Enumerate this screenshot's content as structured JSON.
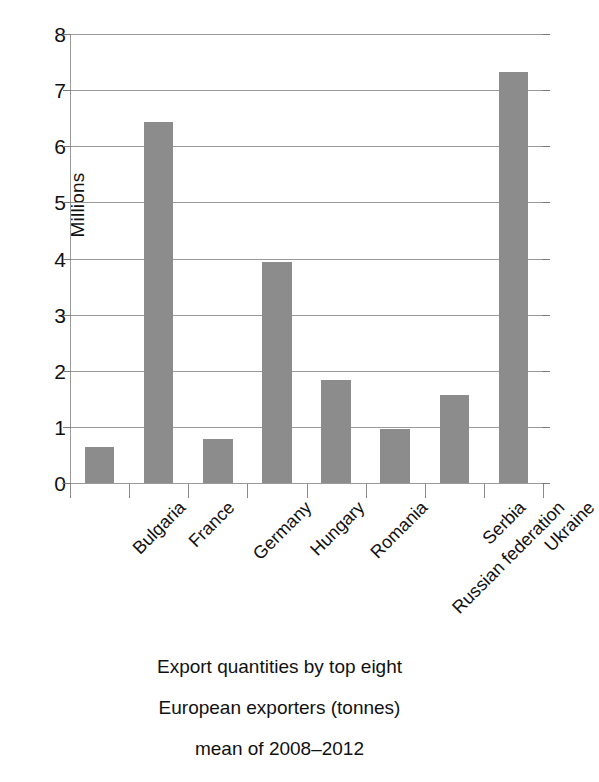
{
  "chart_data": {
    "type": "bar",
    "title": "",
    "categories": [
      "Bulgaria",
      "France",
      "Germany",
      "Hungary",
      "Romania",
      "Russian federation",
      "Serbia",
      "Ukraine"
    ],
    "values": [
      0.65,
      6.43,
      0.79,
      3.93,
      1.84,
      0.97,
      1.56,
      7.32
    ],
    "xlabel": "",
    "ylabel": "Millions",
    "ylim": [
      0,
      8
    ],
    "ytick_labels": [
      "8",
      "7",
      "6",
      "5",
      "4",
      "3",
      "2",
      "1",
      "0"
    ],
    "ytick_values": [
      8,
      7,
      6,
      5,
      4,
      3,
      2,
      1,
      0
    ],
    "grid": true,
    "legend": false,
    "bar_color": "#8c8c8c",
    "gridline_color": "#9a9a9a",
    "axis_color": "#8a8a8a",
    "text_color": "#111111"
  },
  "caption": {
    "lines": [
      "Export quantities by top eight",
      "European exporters (tonnes)",
      "mean of 2008–2012"
    ]
  }
}
